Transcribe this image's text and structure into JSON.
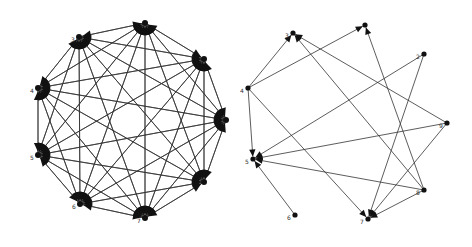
{
  "figure": {
    "background": "#ffffff",
    "edge_color": "#333333",
    "node_color": "#111111"
  },
  "graphs": [
    {
      "id": "complete-digraph",
      "description": "Complete directed graph on 9 nodes arranged in a circle",
      "nodes": [
        {
          "id": "n1",
          "label": "",
          "x": 145,
          "y": 23
        },
        {
          "id": "n3",
          "label": "3",
          "x": 79,
          "y": 37
        },
        {
          "id": "n4",
          "label": "4",
          "x": 38,
          "y": 88
        },
        {
          "id": "n5",
          "label": "5",
          "x": 38,
          "y": 155
        },
        {
          "id": "n6",
          "label": "6",
          "x": 80,
          "y": 204
        },
        {
          "id": "n7",
          "label": "7",
          "x": 145,
          "y": 218
        },
        {
          "id": "n8",
          "label": "",
          "x": 204,
          "y": 182
        },
        {
          "id": "n9",
          "label": "",
          "x": 226,
          "y": 120
        },
        {
          "id": "n2",
          "label": "",
          "x": 204,
          "y": 59
        }
      ],
      "edges": "all-pairs"
    },
    {
      "id": "sparse-digraph",
      "description": "Sparse directed graph on 9 nodes arranged in a circle",
      "nodes": [
        {
          "id": "r3",
          "label": "3",
          "x": 57,
          "y": 33
        },
        {
          "id": "r1",
          "label": "",
          "x": 129,
          "y": 25
        },
        {
          "id": "r2",
          "label": "2",
          "x": 188,
          "y": 54
        },
        {
          "id": "r9",
          "label": "9",
          "x": 211,
          "y": 123
        },
        {
          "id": "r8",
          "label": "8",
          "x": 188,
          "y": 190
        },
        {
          "id": "r7",
          "label": "7",
          "x": 132,
          "y": 219
        },
        {
          "id": "r6",
          "label": "6",
          "x": 59,
          "y": 215
        },
        {
          "id": "r5",
          "label": "5",
          "x": 17,
          "y": 159
        },
        {
          "id": "r4",
          "label": "4",
          "x": 12,
          "y": 88
        }
      ],
      "edges": [
        [
          "r4",
          "r3"
        ],
        [
          "r4",
          "r1"
        ],
        [
          "r4",
          "r5"
        ],
        [
          "r4",
          "r7"
        ],
        [
          "r9",
          "r3"
        ],
        [
          "r9",
          "r5"
        ],
        [
          "r9",
          "r7"
        ],
        [
          "r8",
          "r3"
        ],
        [
          "r8",
          "r1"
        ],
        [
          "r8",
          "r5"
        ],
        [
          "r8",
          "r7"
        ],
        [
          "r2",
          "r5"
        ],
        [
          "r2",
          "r7"
        ],
        [
          "r6",
          "r5"
        ]
      ]
    }
  ]
}
